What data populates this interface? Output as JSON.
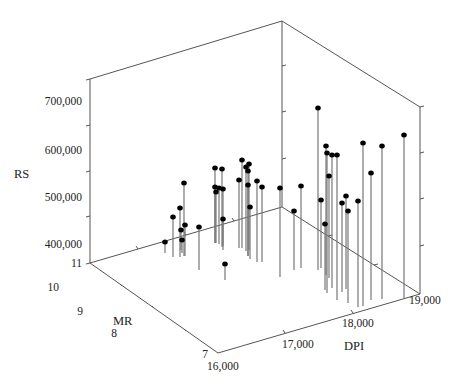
{
  "chart_data": {
    "type": "scatter",
    "subtype": "3d-scatter-with-drop-lines",
    "title": "",
    "axes": {
      "z": {
        "label": "RS",
        "ticks": [
          "400,000",
          "500,000",
          "600,000",
          "700,000"
        ],
        "range": [
          350000,
          750000
        ]
      },
      "y": {
        "label": "MR",
        "ticks": [
          "7",
          "8",
          "9",
          "10",
          "11"
        ],
        "range": [
          7,
          11
        ]
      },
      "x": {
        "label": "DPI",
        "ticks": [
          "16,000",
          "17,000",
          "18,000",
          "19,000"
        ],
        "range": [
          16000,
          19000
        ]
      }
    },
    "grid": false,
    "legend": null,
    "points_screen": [
      {
        "sx": 165,
        "sy": 242,
        "base": 253
      },
      {
        "sx": 173,
        "sy": 217,
        "base": 257
      },
      {
        "sx": 180,
        "sy": 208,
        "base": 257
      },
      {
        "sx": 181,
        "sy": 230,
        "base": 250
      },
      {
        "sx": 182,
        "sy": 240,
        "base": 253
      },
      {
        "sx": 184,
        "sy": 183,
        "base": 256
      },
      {
        "sx": 185,
        "sy": 225,
        "base": 256
      },
      {
        "sx": 199,
        "sy": 227,
        "base": 270
      },
      {
        "sx": 215,
        "sy": 168,
        "base": 243
      },
      {
        "sx": 215,
        "sy": 187,
        "base": 243
      },
      {
        "sx": 216,
        "sy": 192,
        "base": 243
      },
      {
        "sx": 219,
        "sy": 188,
        "base": 244
      },
      {
        "sx": 222,
        "sy": 169,
        "base": 247
      },
      {
        "sx": 223,
        "sy": 219,
        "base": 250
      },
      {
        "sx": 223,
        "sy": 189,
        "base": 246
      },
      {
        "sx": 225,
        "sy": 264,
        "base": 280
      },
      {
        "sx": 239,
        "sy": 180,
        "base": 248
      },
      {
        "sx": 242,
        "sy": 160,
        "base": 248
      },
      {
        "sx": 246,
        "sy": 167,
        "base": 251
      },
      {
        "sx": 248,
        "sy": 171,
        "base": 256
      },
      {
        "sx": 248,
        "sy": 185,
        "base": 256
      },
      {
        "sx": 249,
        "sy": 164,
        "base": 250
      },
      {
        "sx": 250,
        "sy": 207,
        "base": 259
      },
      {
        "sx": 257,
        "sy": 181,
        "base": 262
      },
      {
        "sx": 262,
        "sy": 187,
        "base": 262
      },
      {
        "sx": 280,
        "sy": 188,
        "base": 277
      },
      {
        "sx": 294,
        "sy": 211,
        "base": 270
      },
      {
        "sx": 301,
        "sy": 186,
        "base": 268
      },
      {
        "sx": 318,
        "sy": 108,
        "base": 270
      },
      {
        "sx": 321,
        "sy": 200,
        "base": 268
      },
      {
        "sx": 325,
        "sy": 224,
        "base": 290
      },
      {
        "sx": 326,
        "sy": 146,
        "base": 275
      },
      {
        "sx": 327,
        "sy": 153,
        "base": 293
      },
      {
        "sx": 329,
        "sy": 176,
        "base": 278
      },
      {
        "sx": 332,
        "sy": 155,
        "base": 288
      },
      {
        "sx": 337,
        "sy": 155,
        "base": 300
      },
      {
        "sx": 346,
        "sy": 196,
        "base": 289
      },
      {
        "sx": 348,
        "sy": 211,
        "base": 303
      },
      {
        "sx": 358,
        "sy": 201,
        "base": 307
      },
      {
        "sx": 363,
        "sy": 143,
        "base": 306
      },
      {
        "sx": 371,
        "sy": 173,
        "base": 300
      },
      {
        "sx": 382,
        "sy": 146,
        "base": 299
      },
      {
        "sx": 404,
        "sy": 135,
        "base": 298
      },
      {
        "sx": 342,
        "sy": 203,
        "base": 292
      }
    ]
  },
  "labels": {
    "z_title": "RS",
    "y_title": "MR",
    "x_title": "DPI",
    "z_ticks": [
      {
        "text": "700,000",
        "x": 82,
        "y": 105
      },
      {
        "text": "600,000",
        "x": 82,
        "y": 154
      },
      {
        "text": "500,000",
        "x": 82,
        "y": 201
      },
      {
        "text": "400,000",
        "x": 82,
        "y": 248
      }
    ],
    "y_ticks": [
      {
        "text": "11",
        "x": 82,
        "y": 267
      },
      {
        "text": "10",
        "x": 59,
        "y": 291
      },
      {
        "text": "9",
        "x": 83,
        "y": 315
      },
      {
        "text": "8",
        "x": 117,
        "y": 337
      },
      {
        "text": "7",
        "x": 208,
        "y": 358
      }
    ],
    "x_ticks": [
      {
        "text": "16,000",
        "x": 207,
        "y": 370
      },
      {
        "text": "17,000",
        "x": 282,
        "y": 348
      },
      {
        "text": "18,000",
        "x": 342,
        "y": 327
      },
      {
        "text": "19,000",
        "x": 409,
        "y": 304
      }
    ]
  }
}
